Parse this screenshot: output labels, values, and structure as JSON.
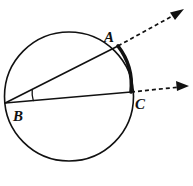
{
  "figure": {
    "background_color": "#ffffff",
    "stroke_color": "#111111",
    "width": 193,
    "height": 186
  },
  "circle": {
    "name": "circle",
    "cx": 69,
    "cy": 96.5,
    "r": 64.5,
    "stroke_width": 1.6,
    "stroke_color": "#111111",
    "fill": "none"
  },
  "points": [
    {
      "id": "A",
      "label": "A",
      "x": 118,
      "y": 46,
      "label_x": 104,
      "label_y": 42
    },
    {
      "id": "B",
      "label": "B",
      "x": 5.2,
      "y": 103,
      "label_x": 13,
      "label_y": 121
    },
    {
      "id": "C",
      "label": "C",
      "x": 131,
      "y": 92,
      "label_x": 135,
      "label_y": 109
    }
  ],
  "rays": [
    {
      "id": "ray-BA",
      "label": "ray B to A",
      "solid": {
        "x1": 5.2,
        "y1": 103,
        "x2": 118,
        "y2": 46
      },
      "dashed": {
        "x1": 118,
        "y1": 46,
        "x2": 176,
        "y2": 14
      },
      "arrow_tip": {
        "x": 182,
        "y": 11
      },
      "stroke_width": 1.6,
      "dash_pattern": "4,3"
    },
    {
      "id": "ray-BC",
      "label": "ray B to C",
      "solid": {
        "x1": 5.2,
        "y1": 103,
        "x2": 131,
        "y2": 92
      },
      "dashed": {
        "x1": 131,
        "y1": 92,
        "x2": 180,
        "y2": 87
      },
      "arrow_tip": {
        "x": 187,
        "y": 86
      },
      "stroke_width": 1.6,
      "dash_pattern": "4,3"
    }
  ],
  "intercepted_arc": {
    "id": "arc-AC",
    "label": "bold intercepted arc from A to C",
    "from": "A",
    "to": "C",
    "path": "M 118 46 A 64.5 64.5 0 0 1 131 92",
    "stroke_width": 3.6,
    "stroke_color": "#111111"
  },
  "angle_marker": {
    "id": "angle-B",
    "label": "inscribed angle at B",
    "vertex": "B",
    "path": "M 32.2 89.9 A 28 28 0 0 0 33.3 100.6",
    "stroke_width": 1.3,
    "stroke_color": "#111111"
  }
}
